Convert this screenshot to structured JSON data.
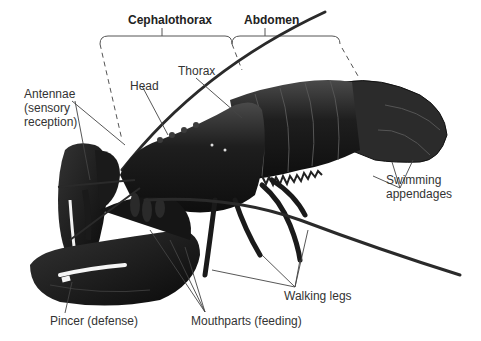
{
  "diagram": {
    "region_labels": {
      "cephalothorax": "Cephalothorax",
      "abdomen": "Abdomen"
    },
    "part_labels": {
      "antennae_line1": "Antennae",
      "antennae_line2": "(sensory",
      "antennae_line3": "reception)",
      "head": "Head",
      "thorax": "Thorax",
      "swimming_line1": "Swimming",
      "swimming_line2": "appendages",
      "walking_legs": "Walking legs",
      "pincer": "Pincer (defense)",
      "mouthparts": "Mouthparts (feeding)"
    },
    "colors": {
      "body": "#1a1a1a",
      "body_highlight": "#3a3a3a",
      "leader_line": "#444444",
      "text": "#333333"
    }
  }
}
